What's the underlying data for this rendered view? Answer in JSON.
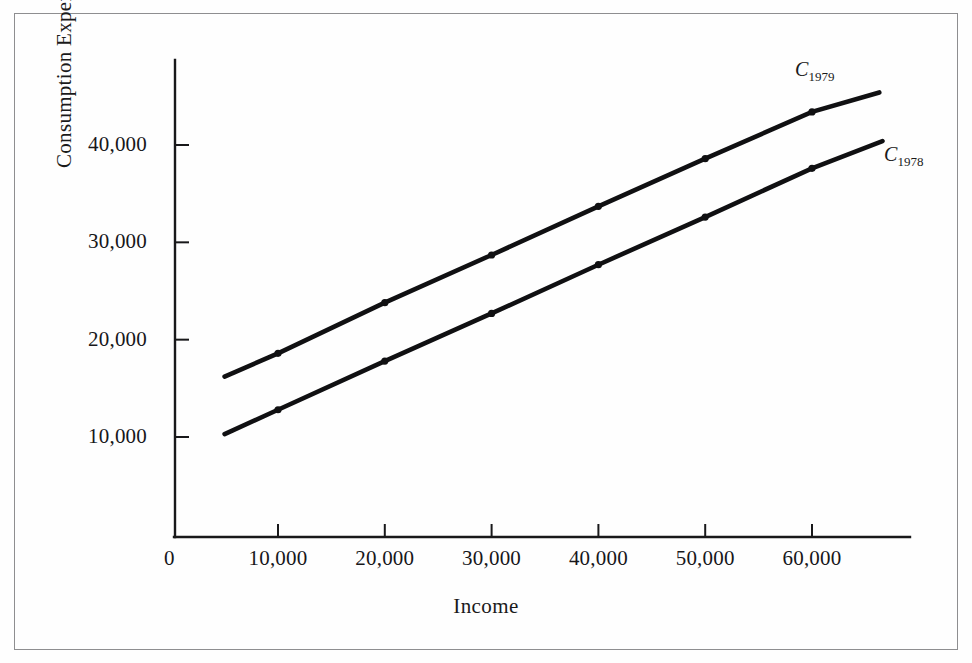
{
  "figure": {
    "frame_border_color": "#8e8e90",
    "background_color": "#fefefe",
    "ink_color": "#101012"
  },
  "axes": {
    "x_title": "Income",
    "y_title": "Consumption Expenditures",
    "origin_label": "0",
    "x_tick_labels": [
      "10,000",
      "20,000",
      "30,000",
      "40,000",
      "50,000",
      "60,000"
    ],
    "y_tick_labels": [
      "10,000",
      "20,000",
      "30,000",
      "40,000"
    ]
  },
  "labels": {
    "curve_upper_base": "C",
    "curve_upper_sub": "1979",
    "curve_lower_base": "C",
    "curve_lower_sub": "1978"
  },
  "chart_data": {
    "type": "line",
    "title": "",
    "subtitle": "",
    "xlabel": "Income",
    "ylabel": "Consumption Expenditures",
    "xlim": [
      0,
      69000
    ],
    "ylim": [
      0,
      47500
    ],
    "xticks": [
      10000,
      20000,
      30000,
      40000,
      50000,
      60000
    ],
    "yticks": [
      10000,
      20000,
      30000,
      40000
    ],
    "grid": false,
    "legend": "inline-end-labels",
    "annotations": [
      {
        "text": "C_1979",
        "x": 62000,
        "y": 45600,
        "series": "C_1979"
      },
      {
        "text": "C_1978",
        "x": 67500,
        "y": 38800,
        "series": "C_1978"
      }
    ],
    "series": [
      {
        "name": "C_1979",
        "label": "C1979",
        "color": "#101012",
        "marker": "circle",
        "x": [
          5000,
          10000,
          20000,
          30000,
          40000,
          50000,
          60000,
          66300
        ],
        "y": [
          16200,
          18600,
          23800,
          28700,
          33700,
          38600,
          43400,
          45400
        ],
        "markers_x": [
          10000,
          20000,
          30000,
          40000,
          50000,
          60000
        ],
        "markers_y": [
          18600,
          23800,
          28700,
          33700,
          38600,
          43400
        ]
      },
      {
        "name": "C_1978",
        "label": "C1978",
        "color": "#101012",
        "marker": "circle",
        "x": [
          5000,
          10000,
          20000,
          30000,
          40000,
          50000,
          60000,
          66600
        ],
        "y": [
          10300,
          12800,
          17800,
          22700,
          27700,
          32600,
          37600,
          40400
        ],
        "markers_x": [
          10000,
          20000,
          30000,
          40000,
          50000,
          60000
        ],
        "markers_y": [
          12800,
          17800,
          22700,
          27700,
          32600,
          37600
        ]
      }
    ]
  }
}
